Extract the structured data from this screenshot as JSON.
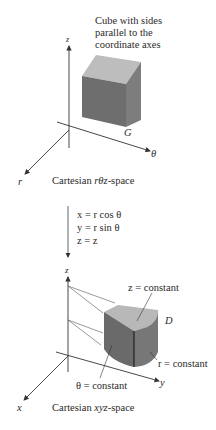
{
  "top_diagram": {
    "annotation": [
      "Cube with sides",
      "parallel to the",
      "coordinate axes"
    ],
    "axis_labels": {
      "vertical": "z",
      "horizontal": "θ",
      "diagonal": "r"
    },
    "region_label": "G",
    "caption_prefix": "Cartesian ",
    "caption_var": "rθz",
    "caption_suffix": "-space"
  },
  "transformation": {
    "equations": [
      "x = r cos θ",
      "y = r sin θ",
      "z = z"
    ]
  },
  "bottom_diagram": {
    "axis_labels": {
      "vertical": "z",
      "horizontal": "y",
      "diagonal": "x"
    },
    "region_label": "D",
    "surface_labels": {
      "top": "z = constant",
      "curved": "r = constant",
      "side": "θ = constant"
    },
    "caption_prefix": "Cartesian ",
    "caption_var": "xyz",
    "caption_suffix": "-space"
  },
  "colors": {
    "cube_top": "#bdbdbd",
    "cube_front": "#6e6e6e",
    "cube_side": "#7d7d7d",
    "axis": "#333333"
  }
}
